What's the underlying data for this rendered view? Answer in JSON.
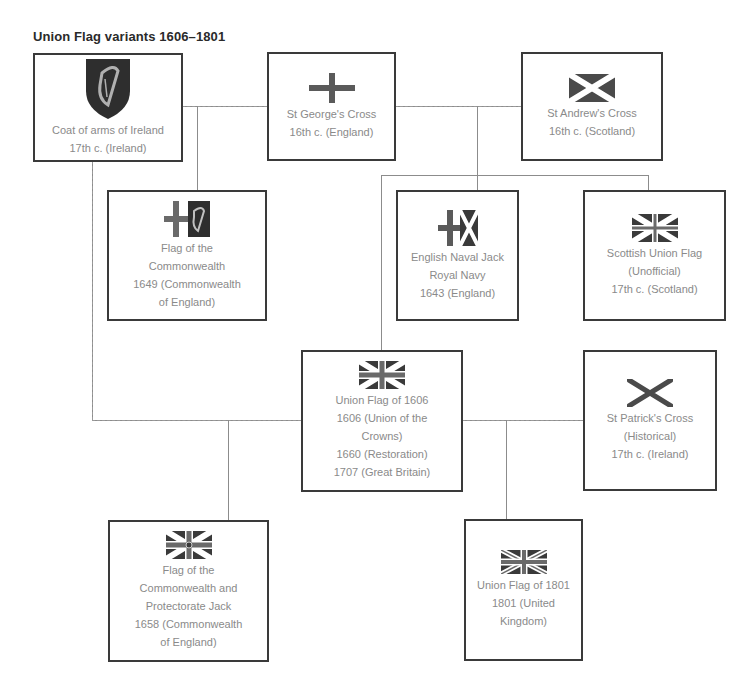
{
  "title": "Union Flag variants 1606–1801",
  "colors": {
    "box_border": "#3a3a3a",
    "label_text": "#8a8a8a",
    "title_text": "#2a2a2a",
    "connector": "#8c8c8c",
    "flag_dark": "#3c3c3c"
  },
  "nodes": {
    "coat_of_arms_ireland": {
      "icon": "harp-shield-icon",
      "lines": [
        "Coat of arms of Ireland",
        "17th c. (Ireland)"
      ]
    },
    "st_george": {
      "icon": "st-george-cross-icon",
      "lines": [
        "St George's Cross",
        "16th c. (England)"
      ]
    },
    "st_andrew": {
      "icon": "st-andrew-saltire-icon",
      "lines": [
        "St Andrew's Cross",
        "16th c. (Scotland)"
      ]
    },
    "commonwealth_flag": {
      "icon": "commonwealth-flag-icon",
      "lines": [
        "Flag of the",
        "Commonwealth",
        "1649 (Commonwealth",
        "of England)"
      ]
    },
    "english_naval_jack": {
      "icon": "naval-jack-icon",
      "lines": [
        "English Naval Jack",
        "Royal Navy",
        "1643 (England)"
      ]
    },
    "scottish_union": {
      "icon": "scottish-union-flag-icon",
      "lines": [
        "Scottish Union Flag",
        "(Unofficial)",
        "17th c. (Scotland)"
      ]
    },
    "union_1606": {
      "icon": "union-flag-1606-icon",
      "lines": [
        "Union Flag of 1606",
        "1606 (Union of the",
        "Crowns)",
        "1660 (Restoration)",
        "1707 (Great Britain)"
      ]
    },
    "st_patrick": {
      "icon": "st-patrick-saltire-icon",
      "lines": [
        "St Patrick's Cross",
        "(Historical)",
        "17th c. (Ireland)"
      ]
    },
    "protectorate_jack": {
      "icon": "protectorate-jack-icon",
      "lines": [
        "Flag of the",
        "Commonwealth and",
        "Protectorate Jack",
        "1658 (Commonwealth",
        "of England)"
      ]
    },
    "union_1801": {
      "icon": "union-flag-1801-icon",
      "lines": [
        "Union Flag of 1801",
        "1801 (United",
        "Kingdom)"
      ]
    }
  }
}
